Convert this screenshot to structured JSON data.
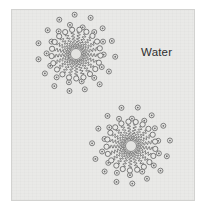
{
  "figure": {
    "background_color": "#e9e9e7",
    "border_color": "#d2d2d0",
    "page_color": "#ffffff",
    "line_color": "#6b6b6b",
    "core_color": "#e3e3e1",
    "text_color": "#2e2e2e"
  },
  "labels": {
    "water": "Water"
  },
  "label_positions": {
    "water": {
      "x": 140,
      "y": 45
    }
  },
  "chart_data": {
    "type": "diagram",
    "annotations": [
      "Water"
    ],
    "structures": [
      {
        "name": "micelle-top-left",
        "center": {
          "x": 75,
          "y": 53
        },
        "core_radius": 5.5,
        "tail_count": 21,
        "tail_inner_radius": 6.5,
        "tail_outer_radius": 22,
        "head_radius": 2.6,
        "tail_wave_amplitude": 1.7,
        "tail_wave_cycles": 5,
        "start_angle_deg": -82,
        "water_shell": [
          {
            "radius": 29,
            "count": 14,
            "start_angle_deg": -76
          },
          {
            "radius": 38,
            "count": 15,
            "start_angle_deg": -68
          }
        ]
      },
      {
        "name": "micelle-bottom-right",
        "center": {
          "x": 130,
          "y": 145
        },
        "core_radius": 5.5,
        "tail_count": 21,
        "tail_inner_radius": 6.5,
        "tail_outer_radius": 22,
        "head_radius": 2.6,
        "tail_wave_amplitude": 1.7,
        "tail_wave_cycles": 5,
        "start_angle_deg": -96,
        "water_shell": [
          {
            "radius": 29,
            "count": 14,
            "start_angle_deg": -88
          },
          {
            "radius": 38,
            "count": 15,
            "start_angle_deg": -80
          }
        ]
      }
    ],
    "water_molecule": {
      "outer_radius": 2.5,
      "inner_radius": 0.9,
      "description": "small open circle with a dot inside"
    }
  }
}
